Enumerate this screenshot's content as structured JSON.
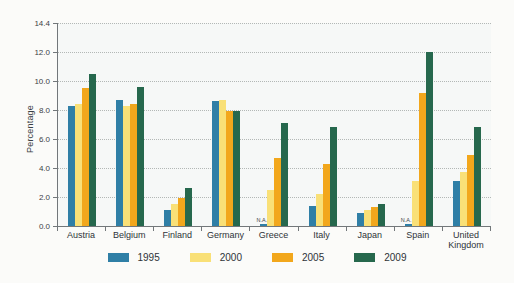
{
  "figure": {
    "background": "#fbfbf9",
    "plot_background": "#f6f8f7",
    "axis_color": "#72777a",
    "grid_color": "#b3b8b6",
    "na_label": "N.A."
  },
  "chart_data": {
    "type": "bar",
    "title": "",
    "xlabel": "",
    "ylabel": "Percentage",
    "ylim": [
      0,
      14.4
    ],
    "yticks": [
      "14.4",
      "12.0",
      "10.0",
      "8.0",
      "6.0",
      "4.0",
      "2.0",
      "0.0"
    ],
    "grid": "horizontal-dotted",
    "legend_position": "bottom",
    "categories": [
      "Austria",
      "Belgium",
      "Finland",
      "Germany",
      "Greece",
      "Italy",
      "Japan",
      "Spain",
      "United Kingdom"
    ],
    "series": [
      {
        "name": "1995",
        "color": "#2f7fa6",
        "values": [
          8.3,
          8.7,
          1.1,
          8.6,
          null,
          1.4,
          0.9,
          null,
          3.1
        ]
      },
      {
        "name": "2000",
        "color": "#f9e077",
        "values": [
          8.4,
          8.3,
          1.5,
          8.7,
          2.5,
          2.2,
          1.1,
          3.1,
          3.7
        ]
      },
      {
        "name": "2005",
        "color": "#f2a71c",
        "values": [
          9.5,
          8.4,
          1.9,
          7.9,
          4.7,
          4.3,
          1.3,
          9.2,
          4.9
        ]
      },
      {
        "name": "2009",
        "color": "#26684d",
        "values": [
          10.5,
          9.6,
          2.6,
          7.9,
          7.1,
          6.8,
          1.5,
          12.0,
          6.8
        ]
      }
    ],
    "na_entries": [
      {
        "category": "Greece",
        "series": "1995"
      },
      {
        "category": "Spain",
        "series": "1995"
      }
    ]
  }
}
